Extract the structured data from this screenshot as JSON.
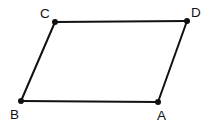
{
  "figure": {
    "shape_type": "parallelogram",
    "background_color": "#ffffff",
    "stroke_color": "#111111",
    "vertex_dot_color": "#111111",
    "label_color": "#111111",
    "stroke_width": 2,
    "vertex_dot_radius": 3,
    "vertices": [
      {
        "id": "C",
        "label": "C",
        "x": 55,
        "y": 22,
        "label_x": 40,
        "label_y": 18
      },
      {
        "id": "D",
        "label": "D",
        "x": 187,
        "y": 21,
        "label_x": 191,
        "label_y": 17
      },
      {
        "id": "A",
        "label": "A",
        "x": 158,
        "y": 102,
        "label_x": 157,
        "label_y": 120
      },
      {
        "id": "B",
        "label": "B",
        "x": 21,
        "y": 101,
        "label_x": 10,
        "label_y": 119
      }
    ],
    "edges": [
      {
        "id": "edge-CD",
        "from": "C",
        "to": "D",
        "label": "C to D"
      },
      {
        "id": "edge-DA",
        "from": "D",
        "to": "A",
        "label": "D to A"
      },
      {
        "id": "edge-AB",
        "from": "A",
        "to": "B",
        "label": "A to B"
      },
      {
        "id": "edge-BC",
        "from": "B",
        "to": "C",
        "label": "B to C"
      }
    ],
    "outline_path": "M 55 22 L 187 21 L 158 102 L 21 101 Z"
  }
}
